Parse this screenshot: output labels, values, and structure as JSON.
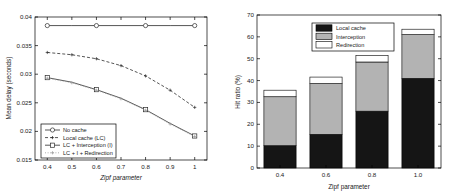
{
  "figure": {
    "background": "#ffffff",
    "panels": [
      "mean-delay-line-chart",
      "hit-ratio-bar-chart"
    ]
  },
  "chart_data": [
    {
      "id": "left",
      "type": "line",
      "title": "",
      "xlabel": "Zipf parameter",
      "ylabel": "Mean delay (seconds)",
      "xlim": [
        0.35,
        1.05
      ],
      "ylim": [
        0.015,
        0.04
      ],
      "xticks": [
        0.4,
        0.5,
        0.6,
        0.7,
        0.8,
        0.9,
        1
      ],
      "xticklabels": [
        "0.4",
        "0.5",
        "0.6",
        "0.7",
        "0.8",
        "0.9",
        "1"
      ],
      "yticks": [
        0.015,
        0.02,
        0.025,
        0.03,
        0.035,
        0.04
      ],
      "yticklabels": [
        "0.015",
        "0.02",
        "0.025",
        "0.03",
        "0.035",
        "0.04"
      ],
      "grid": false,
      "legend_position": "lower-left",
      "x": [
        0.4,
        0.5,
        0.6,
        0.7,
        0.8,
        0.9,
        1.0
      ],
      "series": [
        {
          "name": "No cache",
          "style": "solid",
          "marker": "circle",
          "color": "#2b2b2b",
          "values": [
            0.0385,
            0.0385,
            0.0385,
            0.0385,
            0.0385,
            0.0385,
            0.0385
          ]
        },
        {
          "name": "Local cache (LC)",
          "style": "dashed",
          "marker": "plus",
          "color": "#2b2b2b",
          "values": [
            0.0338,
            0.0334,
            0.0327,
            0.0315,
            0.0297,
            0.0272,
            0.0242
          ]
        },
        {
          "name": "LC + Interception (I)",
          "style": "solid",
          "marker": "square",
          "color": "#2b2b2b",
          "values": [
            0.0294,
            0.0286,
            0.0273,
            0.0258,
            0.0238,
            0.0214,
            0.0192
          ]
        },
        {
          "name": "LC + I + Redirection",
          "style": "dotted",
          "marker": "plus",
          "color": "#9a9a9a",
          "values": [
            0.0293,
            0.0285,
            0.0272,
            0.0257,
            0.0237,
            0.0213,
            0.0191
          ]
        }
      ]
    },
    {
      "id": "right",
      "type": "bar",
      "stacked": true,
      "title": "",
      "xlabel": "Zipf parameter",
      "ylabel": "Hit ratio (%)",
      "ylim": [
        0,
        70
      ],
      "yticks": [
        0,
        10,
        20,
        30,
        40,
        50,
        60,
        70
      ],
      "yticklabels": [
        "0",
        "10",
        "20",
        "30",
        "40",
        "50",
        "60",
        "70"
      ],
      "categories": [
        "0.4",
        "0.6",
        "0.8",
        "1.0"
      ],
      "grid": false,
      "legend_position": "upper-center",
      "series": [
        {
          "name": "Local cache",
          "color": "#151515",
          "values": [
            10.2,
            15.4,
            26.0,
            41.0
          ]
        },
        {
          "name": "Interception",
          "color": "#b3b3b3",
          "values": [
            22.4,
            23.2,
            22.5,
            20.0
          ]
        },
        {
          "name": "Redirection",
          "color": "#ffffff",
          "values": [
            3.0,
            3.0,
            3.0,
            2.5
          ]
        }
      ]
    }
  ]
}
